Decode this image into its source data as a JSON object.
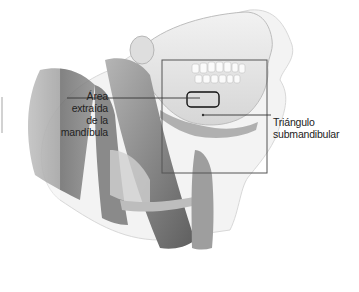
{
  "figure": {
    "type": "anatomical-illustration",
    "colors": {
      "background": "#ffffff",
      "muscle": "#7a7a7a",
      "muscle_dark": "#555555",
      "bone": "#e6e6e6",
      "skin_outline": "#cfcfcf",
      "callout_line": "#333333",
      "frame": "#555555"
    }
  },
  "labels": {
    "extracted_area": {
      "line1": "Área",
      "line2": "extraída",
      "line3": "de la",
      "line4": "mandíbula"
    },
    "submandibular_triangle": {
      "line1": "Triángulo",
      "line2": "submandibular"
    }
  },
  "callouts": {
    "detail_box": {
      "x": 162,
      "y": 60,
      "width": 105,
      "height": 113
    },
    "extracted_region": {
      "x": 187,
      "y": 92,
      "width": 32,
      "height": 15
    }
  }
}
